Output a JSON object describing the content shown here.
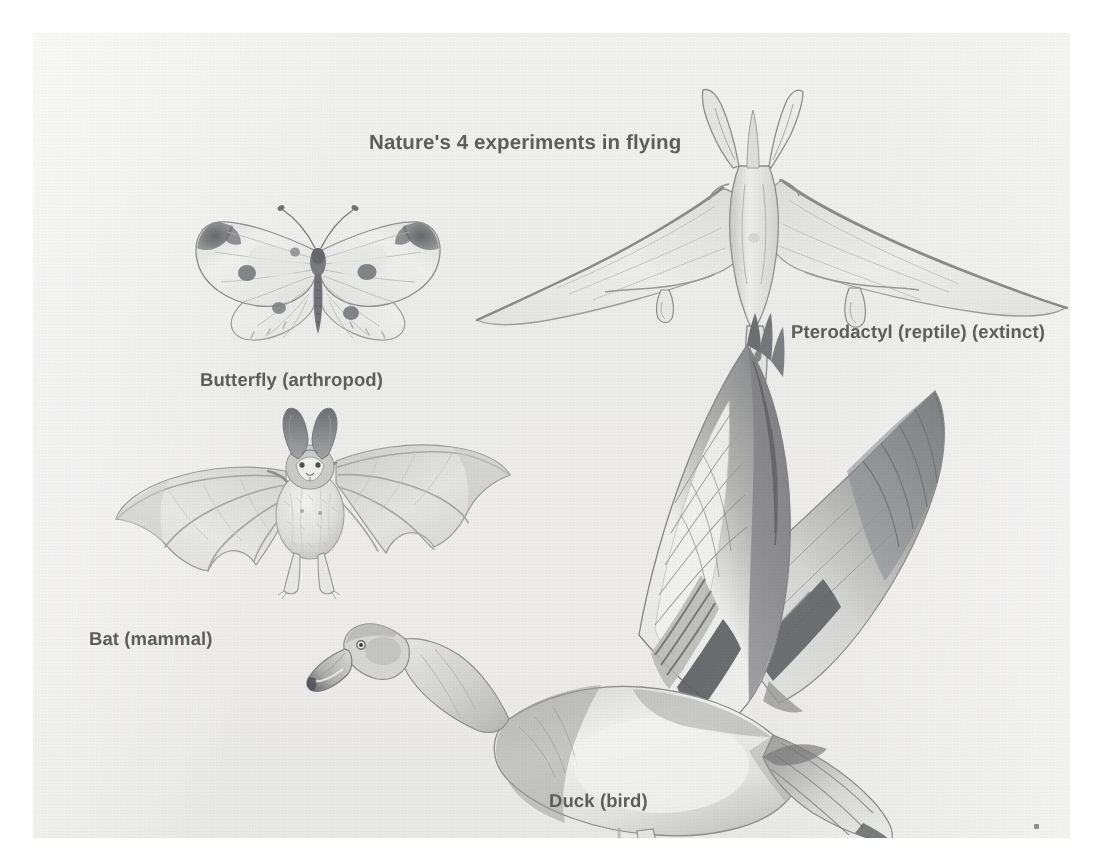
{
  "plate": {
    "title": "Nature's 4 experiments in flying",
    "background_color": "#ececeb",
    "text_color": "#5d5d5d",
    "page_background": "#ffffff",
    "medium": "pencil illustration"
  },
  "labels": {
    "title": "Nature's 4 experiments in flying",
    "butterfly": "Butterfly (arthropod)",
    "pterodactyl": "Pterodactyl (reptile) (extinct)",
    "bat": "Bat (mammal)",
    "duck": "Duck (bird)"
  },
  "figures": [
    {
      "name": "butterfly",
      "label": "Butterfly (arthropod)",
      "group": "arthropod",
      "extinct": false
    },
    {
      "name": "pterodactyl",
      "label": "Pterodactyl (reptile) (extinct)",
      "group": "reptile",
      "extinct": true
    },
    {
      "name": "bat",
      "label": "Bat (mammal)",
      "group": "mammal",
      "extinct": false
    },
    {
      "name": "duck",
      "label": "Duck (bird)",
      "group": "bird",
      "extinct": false
    }
  ],
  "count": 4
}
